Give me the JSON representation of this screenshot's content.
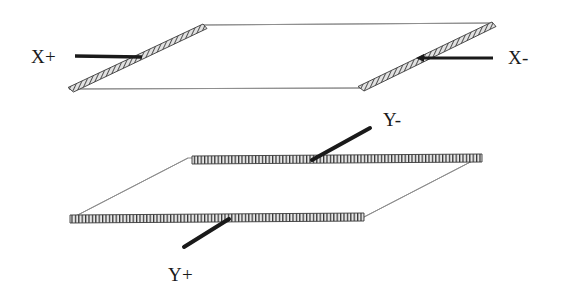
{
  "figure": {
    "background_color": "#ffffff",
    "width": 562,
    "height": 298
  },
  "colors": {
    "outline": "#8a8a8a",
    "hatch_dark": "#2b2b2b",
    "hatch_light": "#d8d8d8",
    "lead_wire": "#1a1a1a",
    "label_text": "#1a1a1a"
  },
  "labels": {
    "x_plus": "X+",
    "x_minus": "X-",
    "y_minus": "Y-",
    "y_plus": "Y+"
  },
  "plates": [
    {
      "id": "upper-plate",
      "name": "x-deflection-plate",
      "orientation": "horizontal-parallelogram",
      "vertices": [
        {
          "x": 203,
          "y": 25
        },
        {
          "x": 492,
          "y": 23
        },
        {
          "x": 360,
          "y": 88
        },
        {
          "x": 69,
          "y": 89
        }
      ],
      "hatched_edges": [
        "left-slant",
        "right-slant"
      ],
      "terminals": [
        "X+",
        "X-"
      ]
    },
    {
      "id": "lower-plate",
      "name": "y-deflection-plate",
      "orientation": "horizontal-parallelogram",
      "vertices": [
        {
          "x": 188,
          "y": 158
        },
        {
          "x": 482,
          "y": 156
        },
        {
          "x": 364,
          "y": 217
        },
        {
          "x": 70,
          "y": 219
        }
      ],
      "hatched_edges": [
        "back-horizontal",
        "front-horizontal"
      ],
      "terminals": [
        "Y-",
        "Y+"
      ]
    }
  ],
  "leads": [
    {
      "id": "lead-x-plus",
      "name": "x-plus-lead",
      "label": "X+",
      "from": {
        "x": 142,
        "y": 57
      },
      "to": {
        "x": 75,
        "y": 56
      },
      "label_position": {
        "x": 31,
        "y": 63
      },
      "has_arrow": false,
      "style": "thick-horizontal"
    },
    {
      "id": "lead-x-minus",
      "name": "x-minus-lead",
      "label": "X-",
      "from": {
        "x": 424,
        "y": 58
      },
      "to": {
        "x": 493,
        "y": 58
      },
      "label_position": {
        "x": 508,
        "y": 64
      },
      "has_arrow": true,
      "style": "thick-horizontal"
    },
    {
      "id": "lead-y-minus",
      "name": "y-minus-lead",
      "label": "Y-",
      "from": {
        "x": 312,
        "y": 160
      },
      "to": {
        "x": 370,
        "y": 128
      },
      "label_position": {
        "x": 383,
        "y": 126
      },
      "has_arrow": false,
      "style": "thick-diagonal"
    },
    {
      "id": "lead-y-plus",
      "name": "y-plus-lead",
      "label": "Y+",
      "from": {
        "x": 229,
        "y": 219
      },
      "to": {
        "x": 184,
        "y": 247
      },
      "label_position": {
        "x": 168,
        "y": 281
      },
      "has_arrow": false,
      "style": "thick-diagonal"
    }
  ]
}
